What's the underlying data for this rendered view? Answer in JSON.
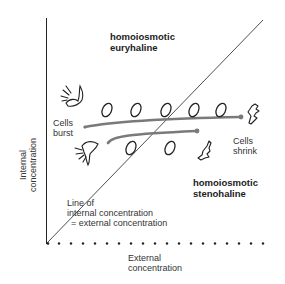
{
  "diagram": {
    "regions": {
      "upper": {
        "line1": "homoiosmotic",
        "line2": "euryhaline"
      },
      "lower": {
        "line1": "homoiosmotic",
        "line2": "stenohaline"
      }
    },
    "annotations": {
      "cells_burst": {
        "line1": "Cells",
        "line2": "burst"
      },
      "cells_shrink": {
        "line1": "Cells",
        "line2": "shrink"
      },
      "isoline": {
        "line1": "Line of",
        "line2": "internal concentration",
        "line3": "= external concentration"
      }
    },
    "axes": {
      "y_label": {
        "line1": "Internal",
        "line2": "concentration"
      },
      "x_label": {
        "line1": "External",
        "line2": "concentration"
      }
    },
    "colors": {
      "line": "#222222",
      "arrow": "#777777",
      "text": "#333333"
    }
  }
}
